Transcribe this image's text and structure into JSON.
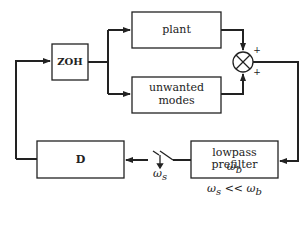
{
  "diagram": {
    "blocks": {
      "zoh": {
        "label": "ZOH"
      },
      "plant": {
        "label": "plant"
      },
      "unwanted": {
        "line1": "unwanted",
        "line2": "modes"
      },
      "prefilter": {
        "line1": "lowpass prefilter",
        "line2": "ω_b"
      },
      "controller": {
        "label": "D"
      }
    },
    "summing_junction": {
      "sign_top": "+",
      "sign_bottom": "+"
    },
    "switch": {
      "label": "ω_s"
    },
    "condition": "ω_s << ω_b",
    "colors": {
      "line": "#222222",
      "background": "#ffffff"
    }
  }
}
